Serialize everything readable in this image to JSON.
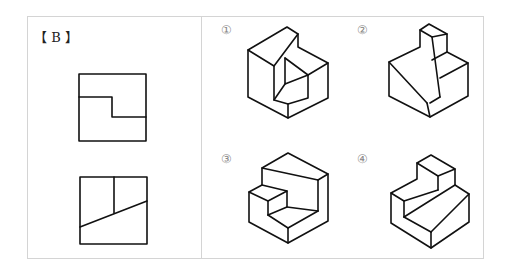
{
  "problem": {
    "label": "【 B 】",
    "views": [
      "top-view",
      "front-view"
    ]
  },
  "options": [
    {
      "id": "①",
      "name": "option-1"
    },
    {
      "id": "②",
      "name": "option-2"
    },
    {
      "id": "③",
      "name": "option-3"
    },
    {
      "id": "④",
      "name": "option-4"
    }
  ]
}
